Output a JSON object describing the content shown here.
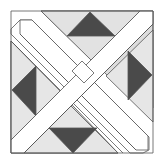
{
  "diagram": {
    "type": "quilt-block",
    "colors": {
      "background": "#ffffff",
      "light_fill": "#dcdcdc",
      "mid_fill": "#e6e6e6",
      "dark_fill": "#4a4a4a",
      "band_fill": "#ffffff",
      "stroke": "#555555"
    },
    "dark_triangles": [
      {
        "position": "top",
        "points": "90,12 67,36 115,36"
      },
      {
        "position": "right",
        "points": "128,51 152,75 128,100"
      },
      {
        "position": "left",
        "points": "36,66 12,90 36,116"
      },
      {
        "position": "bottom",
        "points": "49,128 97,128 73,153"
      }
    ]
  }
}
